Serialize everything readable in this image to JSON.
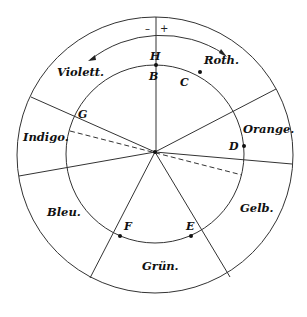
{
  "diagram": {
    "center": [
      155,
      152
    ],
    "outer_radius": 138,
    "middle_arc_radius": 114,
    "inner_radius": 89,
    "line_color": "#333333",
    "text_color": "#111111",
    "signs": {
      "minus": "–",
      "plus": "+"
    },
    "sectors": [
      {
        "name": "Roth.",
        "x": 204,
        "y": 64
      },
      {
        "name": "Orange.",
        "x": 243,
        "y": 130
      },
      {
        "name": "Gelb.",
        "x": 240,
        "y": 212
      },
      {
        "name": "Grün.",
        "x": 142,
        "y": 270
      },
      {
        "name": "Bleu.",
        "x": 47,
        "y": 214
      },
      {
        "name": "Indigo.",
        "x": 23,
        "y": 140
      },
      {
        "name": "Violett.",
        "x": 57,
        "y": 75
      }
    ],
    "points": [
      {
        "label": "H",
        "x": 150,
        "y": 60
      },
      {
        "label": "B",
        "x": 149,
        "y": 80
      },
      {
        "label": "C",
        "x": 180,
        "y": 86
      },
      {
        "label": "D",
        "x": 229,
        "y": 150
      },
      {
        "label": "E",
        "x": 186,
        "y": 230
      },
      {
        "label": "F",
        "x": 124,
        "y": 229
      },
      {
        "label": "G",
        "x": 78,
        "y": 118
      }
    ],
    "spoke_angles_deg": [
      -90,
      -29,
      4,
      59,
      117,
      171,
      205
    ],
    "dashed_line": {
      "from": [
        70,
        131
      ],
      "to": [
        242,
        175
      ]
    }
  }
}
